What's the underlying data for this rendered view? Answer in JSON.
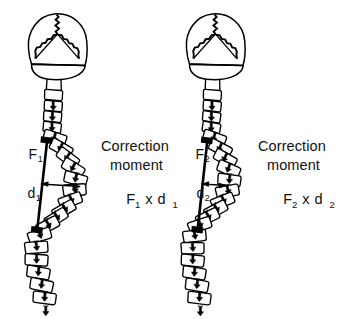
{
  "figure": {
    "type": "biomechanical-diagram",
    "background_color": "#ffffff",
    "ink_color": "#000000",
    "panels": [
      {
        "id": "left",
        "name": "panel-large-curve",
        "force_label": {
          "base": "F",
          "subscript": "1"
        },
        "distance_label": {
          "base": "d",
          "subscript": "1"
        },
        "caption_line_1": "Correction",
        "caption_line_2": "moment",
        "formula": {
          "force": "F",
          "force_sub": "1",
          "operator": "x",
          "distance": "d",
          "distance_sub": "1"
        }
      },
      {
        "id": "right",
        "name": "panel-small-curve",
        "force_label": {
          "base": "F",
          "subscript": "2"
        },
        "distance_label": {
          "base": "d",
          "subscript": "2"
        },
        "caption_line_1": "Correction",
        "caption_line_2": "moment",
        "formula": {
          "force": "F",
          "force_sub": "2",
          "operator": "x",
          "distance": "d",
          "distance_sub": "2"
        }
      }
    ],
    "anatomy": {
      "skull_label": "skull-with-cranial-sutures",
      "spine_label": "vertebral-column-lateral",
      "vertebra_label": "vertebra-with-spinous-process",
      "force_vector_label": "force-line-of-action",
      "moment_arm_label": "moment-arm-double-arrow",
      "anchor_label": "force-application-point"
    }
  }
}
